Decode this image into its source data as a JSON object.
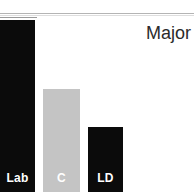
{
  "annotation": {
    "text": "Major"
  },
  "colors": {
    "background": "#ffffff",
    "bar_dark": "#0b0b0b",
    "bar_light": "#c4c4c4",
    "label_text": "#ffffff",
    "annotation_text": "#2b2b2b",
    "rule_line": "#b4b4b4"
  },
  "chart_data": {
    "type": "bar",
    "title": "",
    "subtitle": "",
    "xlabel": "",
    "ylabel": "",
    "grid": false,
    "legend": null,
    "ylim": [
      0,
      100
    ],
    "categories": [
      "Lab",
      "C",
      "LD"
    ],
    "values": [
      100,
      60,
      38
    ],
    "bar_colors": [
      "#0b0b0b",
      "#c4c4c4",
      "#0b0b0b"
    ],
    "annotations": [
      "Major"
    ]
  },
  "bars": [
    {
      "label": "Lab",
      "value": 100,
      "color_key": "bar_dark",
      "left": 0,
      "width": 35,
      "height": 172
    },
    {
      "label": "C",
      "value": 60,
      "color_key": "bar_light",
      "left": 43,
      "width": 37,
      "height": 103
    },
    {
      "label": "LD",
      "value": 38,
      "color_key": "bar_dark",
      "left": 88,
      "width": 35,
      "height": 65
    }
  ]
}
